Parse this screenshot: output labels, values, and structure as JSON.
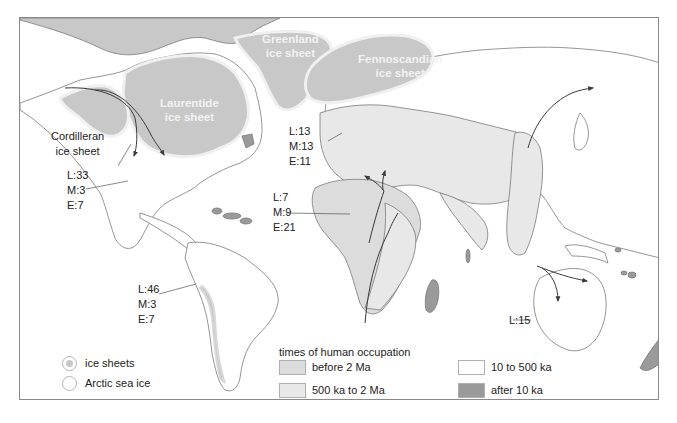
{
  "map": {
    "title": "times of human occupation",
    "colors": {
      "ice_sheet": "#c8c8c8",
      "before_2Ma": "#dcdcdc",
      "500ka_2Ma": "#e8e8e8",
      "10_500ka": "#ffffff",
      "after_10ka": "#9a9a9a",
      "coast": "#7a7a7a",
      "arrow": "#3a3a3a"
    },
    "ice_sheet_labels": {
      "greenland": [
        "Greenland",
        "ice sheet"
      ],
      "laurentide": [
        "Laurentide",
        "ice sheet"
      ],
      "fennoscandian": [
        "Fennoscandian",
        "ice sheet"
      ],
      "cordilleran": [
        "Cordilleran",
        "ice sheet"
      ]
    },
    "regions": [
      {
        "name": "north-america",
        "lines": [
          "L:33",
          "M:3",
          "E:7"
        ]
      },
      {
        "name": "europe",
        "lines": [
          "L:13",
          "M:13",
          "E:11"
        ]
      },
      {
        "name": "africa",
        "lines": [
          "L:7",
          "M:9",
          "E:21"
        ]
      },
      {
        "name": "south-america",
        "lines": [
          "L:46",
          "M:3",
          "E:7"
        ]
      },
      {
        "name": "australia",
        "lines": [
          "L:15"
        ]
      }
    ]
  },
  "legend": {
    "ice": [
      {
        "label": "ice sheets"
      },
      {
        "label": "Arctic sea ice"
      }
    ],
    "occupation_title": "times of human occupation",
    "occupation": [
      {
        "label": "before 2 Ma",
        "color": "#dcdcdc"
      },
      {
        "label": "500 ka to 2 Ma",
        "color": "#e8e8e8"
      },
      {
        "label": "10 to 500 ka",
        "color": "#ffffff"
      },
      {
        "label": "after 10 ka",
        "color": "#9a9a9a"
      }
    ]
  }
}
